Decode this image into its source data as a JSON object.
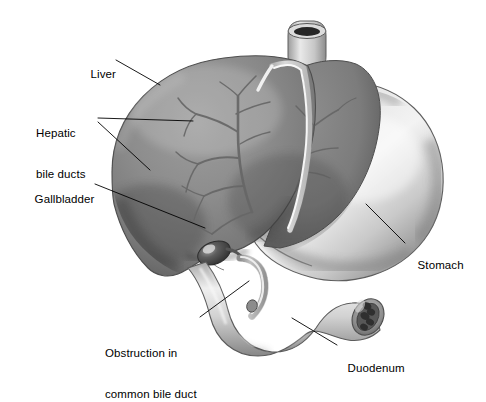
{
  "figure": {
    "title": "Obstruction in common bile duct",
    "style": "grayscale airbrush medical illustration",
    "width": 486,
    "height": 389,
    "background_color": "#ffffff"
  },
  "labels": [
    {
      "id": "liver",
      "text": "Liver",
      "x": 84,
      "y": 54,
      "align": "left"
    },
    {
      "id": "hepatic",
      "line1": "Hepatic",
      "line2": "bile ducts",
      "x": 36,
      "y": 100,
      "align": "left"
    },
    {
      "id": "gallbladder",
      "text": "Gallbladder",
      "x": 28,
      "y": 179,
      "align": "left"
    },
    {
      "id": "obstruction",
      "line1": "Obstruction in",
      "line2": "common bile duct",
      "x": 105,
      "y": 320,
      "align": "left"
    },
    {
      "id": "stomach",
      "text": "Stomach",
      "x": 411,
      "y": 245,
      "align": "left"
    },
    {
      "id": "duodenum",
      "text": "Duodenum",
      "x": 341,
      "y": 348,
      "align": "left"
    }
  ],
  "structures": {
    "liver": {
      "name": "Liver",
      "fill": "#8b8b8b",
      "shadow": "#5f5f5f",
      "highlight": "#a2a2a2"
    },
    "stomach": {
      "name": "Stomach",
      "fill": "#d4d4d4",
      "shadow": "#9a9a9a",
      "highlight": "#f0f0f0"
    },
    "duodenum": {
      "name": "Duodenum",
      "fill": "#cfcfcf",
      "shadow": "#8f8f8f",
      "highlight": "#efefef"
    },
    "esophagus": {
      "name": "Esophagus",
      "fill": "#c9c9c9",
      "lumen": "#2a2a2a"
    },
    "gallbladder": {
      "name": "Gallbladder",
      "fill": "#4f4f4f",
      "highlight": "#cfcfcf"
    },
    "bile_ducts": {
      "name": "Hepatic bile ducts",
      "stroke": "#6c6c6c"
    },
    "ligament": {
      "name": "Falciform ligament",
      "fill": "#f2f2f2"
    },
    "common_bile_duct": {
      "name": "Common bile duct",
      "fill": "#d8d8d8"
    },
    "duodenal_folds": {
      "name": "Duodenal mucosal folds",
      "fill": "#3a3a3a"
    }
  },
  "leaders": {
    "stroke": "#000000",
    "width": 0.9
  }
}
